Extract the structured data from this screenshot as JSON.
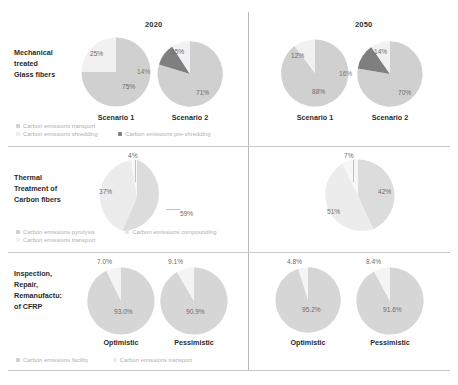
{
  "columns": [
    {
      "id": "col-2020",
      "label": "2020"
    },
    {
      "id": "col-2050",
      "label": "2050"
    }
  ],
  "rows": [
    {
      "id": "row-mechanical",
      "label": "Mechanical\ntreated\nGlass fibers"
    },
    {
      "id": "row-thermal",
      "label": "Thermal\nTreatment of\nCarbon fibers"
    },
    {
      "id": "row-inspection",
      "label": "Inspection,\nRepair,\nRemanufactu:\nof CFRP"
    }
  ],
  "colors": {
    "light": "#eeeeee",
    "medium": "#d0d0d0",
    "dark": "#7f7f7f",
    "label_text": "#6d6d6d",
    "legend_text": "#b0b0b0",
    "divider": "#c2c2c2"
  },
  "legends": {
    "mechanical": [
      {
        "label": "Carbon emissions transport",
        "color": "#d0d0d0"
      },
      {
        "label": "Carbon emissions shredding",
        "color": "#eeeeee"
      },
      {
        "label": "Carbon emissions pre-shredding",
        "color": "#7f7f7f"
      }
    ],
    "thermal": [
      {
        "label": "Carbon emissions pyrolysis",
        "color": "#d0d0d0"
      },
      {
        "label": "Carbon emissions compounding",
        "color": "#e6e6e6"
      },
      {
        "label": "Carbon emissions transport",
        "color": "#f2f2f2"
      }
    ],
    "inspection": [
      {
        "label": "Carbon emissions facility",
        "color": "#d0d0d0"
      },
      {
        "label": "Carbon emissions transport",
        "color": "#eeeeee"
      }
    ]
  },
  "chart_data": [
    {
      "id": "pie-mech-2020-s1",
      "type": "pie",
      "title": "Mechanical treated Glass fibers – 2020 – Scenario 1",
      "caption": "Scenario 1",
      "labels": [
        "Carbon emissions transport",
        "Carbon emissions shredding"
      ],
      "values": [
        75,
        25
      ],
      "value_labels": [
        "75%",
        "25%"
      ],
      "colors": [
        "#d0d0d0",
        "#f1f1f1"
      ]
    },
    {
      "id": "pie-mech-2020-s2",
      "type": "pie",
      "title": "Mechanical treated Glass fibers – 2020 – Scenario 2",
      "caption": "Scenario 2",
      "labels": [
        "Carbon emissions transport",
        "Carbon emissions shredding",
        "Carbon emissions pre-shredding"
      ],
      "values": [
        71,
        15,
        14
      ],
      "value_labels": [
        "71%",
        "15%",
        "14%"
      ],
      "colors": [
        "#d0d0d0",
        "#f1f1f1",
        "#7f7f7f"
      ]
    },
    {
      "id": "pie-mech-2050-s1",
      "type": "pie",
      "title": "Mechanical treated Glass fibers – 2050 – Scenario 1",
      "caption": "Scenario 1",
      "labels": [
        "Carbon emissions transport",
        "Carbon emissions shredding"
      ],
      "values": [
        88,
        12
      ],
      "value_labels": [
        "88%",
        "12%"
      ],
      "colors": [
        "#d0d0d0",
        "#f1f1f1"
      ]
    },
    {
      "id": "pie-mech-2050-s2",
      "type": "pie",
      "title": "Mechanical treated Glass fibers – 2050 – Scenario 2",
      "caption": "Scenario 2",
      "labels": [
        "Carbon emissions transport",
        "Carbon emissions shredding",
        "Carbon emissions pre-shredding"
      ],
      "values": [
        70,
        14,
        16
      ],
      "value_labels": [
        "70%",
        "14%",
        "16%"
      ],
      "colors": [
        "#d0d0d0",
        "#f1f1f1",
        "#7f7f7f"
      ]
    },
    {
      "id": "pie-thermal-2020",
      "type": "pie",
      "title": "Thermal Treatment of Carbon fibers – 2020",
      "caption": "",
      "labels": [
        "Carbon emissions compounding",
        "Carbon emissions pyrolysis",
        "Carbon emissions transport"
      ],
      "values": [
        59,
        37,
        4
      ],
      "value_labels": [
        "59%",
        "37%",
        "4%"
      ],
      "colors": [
        "#dcdcdc",
        "#ececec",
        "#f7f7f7"
      ]
    },
    {
      "id": "pie-thermal-2050",
      "type": "pie",
      "title": "Thermal Treatment of Carbon fibers – 2050",
      "caption": "",
      "labels": [
        "Carbon emissions compounding",
        "Carbon emissions pyrolysis",
        "Carbon emissions transport"
      ],
      "values": [
        42,
        51,
        7
      ],
      "value_labels": [
        "42%",
        "51%",
        "7%"
      ],
      "colors": [
        "#dcdcdc",
        "#ececec",
        "#f7f7f7"
      ]
    },
    {
      "id": "pie-insp-2020-opt",
      "type": "pie",
      "title": "Inspection, Repair, Remanufacture of CFRP – 2020 – Optimistic",
      "caption": "Optimistic",
      "labels": [
        "Carbon emissions facility",
        "Carbon emissions transport"
      ],
      "values": [
        93.0,
        7.0
      ],
      "value_labels": [
        "93.0%",
        "7.0%"
      ],
      "colors": [
        "#d6d6d6",
        "#f4f4f4"
      ]
    },
    {
      "id": "pie-insp-2020-pes",
      "type": "pie",
      "title": "Inspection, Repair, Remanufacture of CFRP – 2020 – Pessimistic",
      "caption": "Pessimistic",
      "labels": [
        "Carbon emissions facility",
        "Carbon emissions transport"
      ],
      "values": [
        90.9,
        9.1
      ],
      "value_labels": [
        "90.9%",
        "9.1%"
      ],
      "colors": [
        "#d6d6d6",
        "#f4f4f4"
      ]
    },
    {
      "id": "pie-insp-2050-opt",
      "type": "pie",
      "title": "Inspection, Repair, Remanufacture of CFRP – 2050 – Optimistic",
      "caption": "Optimistic",
      "labels": [
        "Carbon emissions facility",
        "Carbon emissions transport"
      ],
      "values": [
        95.2,
        4.8
      ],
      "value_labels": [
        "95.2%",
        "4.8%"
      ],
      "colors": [
        "#d6d6d6",
        "#f4f4f4"
      ]
    },
    {
      "id": "pie-insp-2050-pes",
      "type": "pie",
      "title": "Inspection, Repair, Remanufacture of CFRP – 2050 – Pessimistic",
      "caption": "Pessimistic",
      "labels": [
        "Carbon emissions facility",
        "Carbon emissions transport"
      ],
      "values": [
        91.6,
        8.4
      ],
      "value_labels": [
        "91.6%",
        "8.4%"
      ],
      "colors": [
        "#d6d6d6",
        "#f4f4f4"
      ]
    }
  ]
}
